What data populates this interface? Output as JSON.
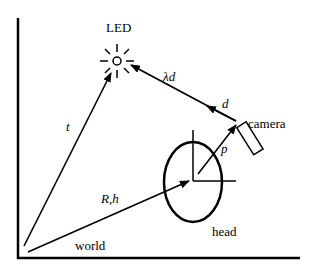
{
  "diagram": {
    "labels": {
      "led": "LED",
      "t": "t",
      "lambda_d": "λd",
      "d": "d",
      "camera": "camera",
      "p": "p",
      "rh": "R,h",
      "head": "head",
      "world": "world"
    },
    "colors": {
      "stroke": "#000000",
      "background": "#ffffff"
    }
  }
}
